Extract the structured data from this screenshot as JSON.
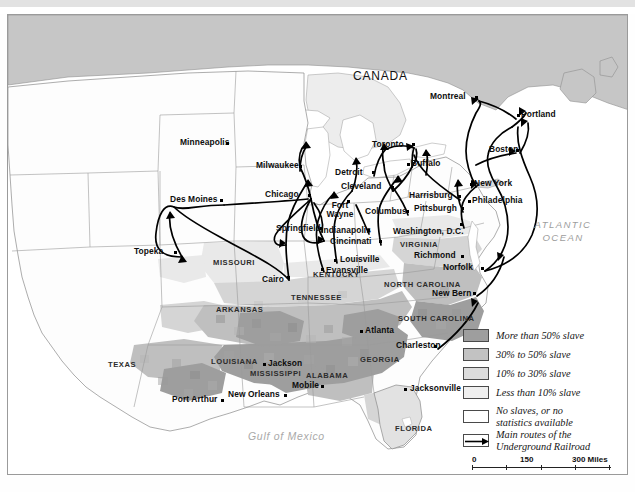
{
  "map": {
    "title_region": "United States",
    "country_labels": [
      {
        "name": "CANADA",
        "x": 352,
        "y": 62
      }
    ],
    "ocean_labels": [
      {
        "name": "ATLANTIC\nOCEAN",
        "line1": "ATLANTIC",
        "line2": "OCEAN",
        "x": 555,
        "y": 212
      }
    ],
    "water_labels": [
      {
        "name": "Gulf of Mexico",
        "x": 255,
        "y": 424
      }
    ],
    "states": [
      {
        "name": "MISSOURI",
        "x": 215,
        "y": 250
      },
      {
        "name": "ARKANSAS",
        "x": 218,
        "y": 297
      },
      {
        "name": "TENNESSEE",
        "x": 297,
        "y": 285
      },
      {
        "name": "KENTUCKY",
        "x": 317,
        "y": 262
      },
      {
        "name": "MISSISSIPPI",
        "x": 258,
        "y": 361
      },
      {
        "name": "ALABAMA",
        "x": 310,
        "y": 363
      },
      {
        "name": "LOUISIANA",
        "x": 215,
        "y": 349
      },
      {
        "name": "GEORGIA",
        "x": 363,
        "y": 347
      },
      {
        "name": "TEXAS",
        "x": 112,
        "y": 352
      },
      {
        "name": "FLORIDA",
        "x": 400,
        "y": 416
      },
      {
        "name": "VIRGINIA",
        "x": 404,
        "y": 232
      },
      {
        "name": "NORTH CAROLINA",
        "x": 394,
        "y": 272
      },
      {
        "name": "SOUTH CAROLINA",
        "x": 403,
        "y": 308
      }
    ],
    "cities": [
      {
        "name": "Minneapolis",
        "lx": 180,
        "ly": 129,
        "dx": 222,
        "dy": 131
      },
      {
        "name": "Milwaukee",
        "lx": 256,
        "ly": 152,
        "dx": 292,
        "dy": 156
      },
      {
        "name": "Chicago",
        "lx": 264,
        "ly": 181,
        "dx": 303,
        "dy": 184
      },
      {
        "name": "Des Moines",
        "lx": 170,
        "ly": 186,
        "dx": 216,
        "dy": 190
      },
      {
        "name": "Topeka",
        "lx": 133,
        "ly": 238,
        "dx": 174,
        "dy": 242
      },
      {
        "name": "Springfield",
        "lx": 276,
        "ly": 215,
        "dx": 314,
        "dy": 217
      },
      {
        "name": "Fort Wayne",
        "lx": 322,
        "ly": 193,
        "dx": 341,
        "dy": 190,
        "two_line": true,
        "line1": "Fort",
        "line2": "Wayne"
      },
      {
        "name": "Indianapolis",
        "lx": 320,
        "ly": 217,
        "dx": 361,
        "dy": 219
      },
      {
        "name": "Cincinnati",
        "lx": 330,
        "ly": 228,
        "dx": 373,
        "dy": 230
      },
      {
        "name": "Detroit",
        "lx": 335,
        "ly": 159,
        "dx": 366,
        "dy": 161
      },
      {
        "name": "Cleveland",
        "lx": 341,
        "ly": 173,
        "dx": 385,
        "dy": 176
      },
      {
        "name": "Columbus",
        "lx": 365,
        "ly": 198,
        "dx": 400,
        "dy": 200
      },
      {
        "name": "Toronto",
        "lx": 372,
        "ly": 131,
        "dx": 406,
        "dy": 133
      },
      {
        "name": "Buffalo",
        "lx": 409,
        "ly": 150,
        "dx": 404,
        "dy": 152
      },
      {
        "name": "Harrisburg",
        "lx": 409,
        "ly": 182,
        "dx": 452,
        "dy": 185
      },
      {
        "name": "Pittsburgh",
        "lx": 414,
        "ly": 195,
        "dx": 455,
        "dy": 197
      },
      {
        "name": "Philadelphia",
        "lx": 472,
        "ly": 187,
        "dx": 470,
        "dy": 189
      },
      {
        "name": "New York",
        "lx": 472,
        "ly": 170,
        "dx": 468,
        "dy": 172
      },
      {
        "name": "Boston",
        "lx": 489,
        "ly": 136,
        "dx": 512,
        "dy": 138
      },
      {
        "name": "Portland",
        "lx": 521,
        "ly": 101,
        "dx": 517,
        "dy": 103
      },
      {
        "name": "Montreal",
        "lx": 430,
        "ly": 83,
        "dx": 471,
        "dy": 86
      },
      {
        "name": "Washington, D.C.",
        "lx": 393,
        "ly": 218,
        "dx": 456,
        "dy": 213
      },
      {
        "name": "Richmond",
        "lx": 414,
        "ly": 242,
        "dx": 457,
        "dy": 244
      },
      {
        "name": "Norfolk",
        "lx": 443,
        "ly": 254,
        "dx": 477,
        "dy": 256
      },
      {
        "name": "New Bern",
        "lx": 432,
        "ly": 280,
        "dx": 469,
        "dy": 281
      },
      {
        "name": "Louisville",
        "lx": 334,
        "ly": 246,
        "dx": 329,
        "dy": 248
      },
      {
        "name": "Evansville",
        "lx": 320,
        "ly": 257,
        "dx": 316,
        "dy": 257
      },
      {
        "name": "Cairo",
        "lx": 262,
        "ly": 266,
        "dx": 281,
        "dy": 265
      },
      {
        "name": "Atlanta",
        "lx": 359,
        "ly": 317,
        "dx": 355,
        "dy": 319
      },
      {
        "name": "Charleston",
        "lx": 396,
        "ly": 332,
        "dx": 430,
        "dy": 334
      },
      {
        "name": "Jacksonville",
        "lx": 404,
        "ly": 375,
        "dx": 400,
        "dy": 377
      },
      {
        "name": "Jackson",
        "lx": 262,
        "ly": 350,
        "dx": 258,
        "dy": 352
      },
      {
        "name": "New Orleans",
        "lx": 228,
        "ly": 381,
        "dx": 280,
        "dy": 383
      },
      {
        "name": "Port Arthur",
        "lx": 172,
        "ly": 386,
        "dx": 217,
        "dy": 388
      },
      {
        "name": "Mobile",
        "lx": 288,
        "ly": 372,
        "dx": 307,
        "dy": 374
      }
    ]
  },
  "legend": {
    "items": [
      {
        "label": "More than 50% slave",
        "color": "#9e9e9e",
        "pattern": "dark"
      },
      {
        "label": "30% to 50% slave",
        "color": "#bdbdbd",
        "pattern": "mid"
      },
      {
        "label": "10% to 30% slave",
        "color": "#d8d8d8",
        "pattern": "light"
      },
      {
        "label": "Less than 10% slave",
        "color": "#ececec",
        "pattern": "verylight"
      },
      {
        "label": "No slaves, or no\nstatistics available",
        "line1": "No slaves, or no",
        "line2": "statistics available",
        "color": "#ffffff",
        "pattern": "none"
      },
      {
        "label": "Main routes of the\nUnderground Railroad",
        "line1": "Main routes of the",
        "line2": "Underground Railroad",
        "color": "#ffffff",
        "pattern": "arrow"
      }
    ]
  },
  "scale": {
    "miles": {
      "ticks": [
        "0",
        "150",
        "300"
      ],
      "unit": "Miles",
      "unit_label": "300 Miles"
    },
    "kilometers": {
      "ticks": [
        "0",
        "150",
        "300"
      ],
      "unit": "Kilometers"
    }
  },
  "colors": {
    "slave_over50": "#9e9e9e",
    "slave_30_50": "#bdbdbd",
    "slave_10_30": "#d8d8d8",
    "slave_under10": "#ececec",
    "no_slaves": "#fdfdfd",
    "canada": "#c8c8c8",
    "ocean": "#ffffff",
    "border": "#8a8a8a",
    "route": "#000000"
  }
}
